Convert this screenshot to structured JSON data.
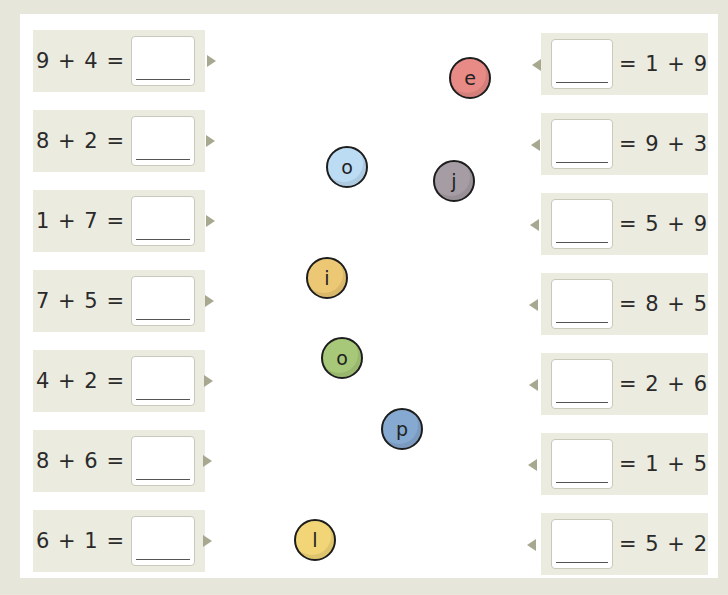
{
  "left_equations": [
    {
      "expr": "9 + 4 =",
      "answer": ""
    },
    {
      "expr": "8 + 2 =",
      "answer": ""
    },
    {
      "expr": "1 + 7 =",
      "answer": ""
    },
    {
      "expr": "7 + 5 =",
      "answer": ""
    },
    {
      "expr": "4 + 2 =",
      "answer": ""
    },
    {
      "expr": "8 + 6 =",
      "answer": ""
    },
    {
      "expr": "6 + 1 =",
      "answer": ""
    }
  ],
  "right_equations": [
    {
      "expr": "= 1 + 9",
      "answer": ""
    },
    {
      "expr": "= 9 + 3",
      "answer": ""
    },
    {
      "expr": "= 5 + 9",
      "answer": ""
    },
    {
      "expr": "= 8 + 5",
      "answer": ""
    },
    {
      "expr": "= 2 + 6",
      "answer": ""
    },
    {
      "expr": "= 1 + 5",
      "answer": ""
    },
    {
      "expr": "= 5 + 2",
      "answer": ""
    }
  ],
  "beads": [
    {
      "letter": "e",
      "color": "#e88a86",
      "x": 449,
      "y": 57
    },
    {
      "letter": "o",
      "color": "#bcdcf4",
      "x": 326,
      "y": 146
    },
    {
      "letter": "j",
      "color": "#a59da3",
      "x": 433,
      "y": 160
    },
    {
      "letter": "i",
      "color": "#edc874",
      "x": 306,
      "y": 257
    },
    {
      "letter": "o",
      "color": "#a6c878",
      "x": 321,
      "y": 337
    },
    {
      "letter": "p",
      "color": "#85a9d0",
      "x": 381,
      "y": 408
    },
    {
      "letter": "l",
      "color": "#f1d576",
      "x": 294,
      "y": 519
    }
  ]
}
